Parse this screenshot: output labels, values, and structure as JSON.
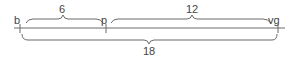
{
  "diagram": {
    "type": "number-line-segments",
    "points": [
      {
        "label": "b",
        "x": 20
      },
      {
        "label": "p",
        "x": 106
      },
      {
        "label": "vg",
        "x": 278
      }
    ],
    "segments": [
      {
        "from": "b",
        "to": "p",
        "length_label": "6",
        "position": "above"
      },
      {
        "from": "p",
        "to": "vg",
        "length_label": "12",
        "position": "above"
      },
      {
        "from": "b",
        "to": "vg",
        "length_label": "18",
        "position": "below"
      }
    ],
    "colors": {
      "line": "#6a6a6a",
      "text": "#444444"
    }
  }
}
